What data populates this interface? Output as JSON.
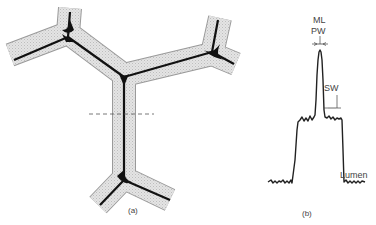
{
  "figure": {
    "panel_a": {
      "caption": "(a)",
      "description": "Cross-section of three-way cell wall junctions (Y-shaped), with shaded secondary walls and dark middle lamella; dashed line marks scan path"
    },
    "panel_b": {
      "caption": "(b)",
      "labels": {
        "ml": "ML",
        "pw": "PW",
        "sw": "SW",
        "lumen": "Lumen"
      }
    },
    "colors": {
      "wall_fill": "#d8d8d8",
      "middle_lamella": "#111111",
      "trace": "#222222"
    }
  }
}
